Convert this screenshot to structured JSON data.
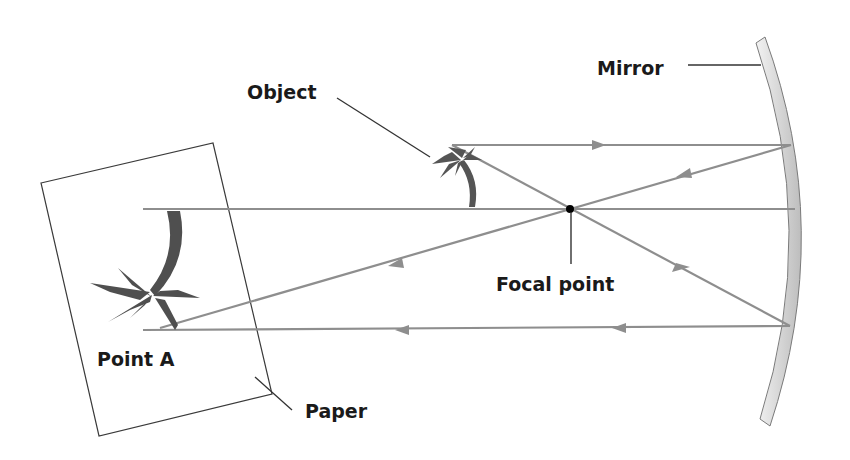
{
  "diagram": {
    "type": "concave-mirror-ray-diagram",
    "labels": {
      "mirror": "Mirror",
      "object": "Object",
      "focal_point": "Focal point",
      "point_a": "Point A",
      "paper": "Paper"
    },
    "colors": {
      "ray": "#8a8a8a",
      "leader": "#333333",
      "mirror_fill": "#d8d8d8",
      "mirror_stroke": "#808080",
      "tree": "#555555",
      "focal_dot": "#000000"
    }
  }
}
